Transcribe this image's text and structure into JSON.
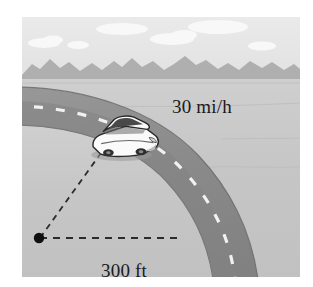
{
  "figure": {
    "kind": "physics-diagram",
    "background_color": "#ffffff"
  },
  "scene": {
    "sky": {
      "name": "sky",
      "color": "#e9e9e9",
      "clouds_color": "#fbfbfb",
      "cloud_count": 5
    },
    "mountains": {
      "name": "mountain-range",
      "color": "#b0b0b0"
    },
    "ground": {
      "name": "ground",
      "color_near": "#c6c6c6",
      "color_far": "#d0d0d0"
    },
    "road": {
      "name": "curved-road",
      "surface_color": "#8e8e8e",
      "shadow_color": "#7d7d7d",
      "edge_color": "#6f6f6f",
      "centerline_color": "#f2f2f2",
      "centerline_style": "dashed"
    },
    "car": {
      "name": "car",
      "body_color": "#fdfdfd",
      "window_color": "#4a4a4a",
      "outline_color": "#2b2b2b",
      "heading": "left-to-right along curve"
    },
    "center_point": {
      "name": "curve-center-point",
      "color": "#0d0d0d"
    },
    "radius_lines": {
      "name": "radius-dashed-lines",
      "color": "#2a2a2a",
      "style": "dashed",
      "count": 2
    }
  },
  "labels": {
    "speed": "30 mi/h",
    "radius": "300 ft"
  },
  "values": {
    "speed_magnitude": 30,
    "speed_unit": "mi/h",
    "radius_magnitude": 300,
    "radius_unit": "ft"
  }
}
